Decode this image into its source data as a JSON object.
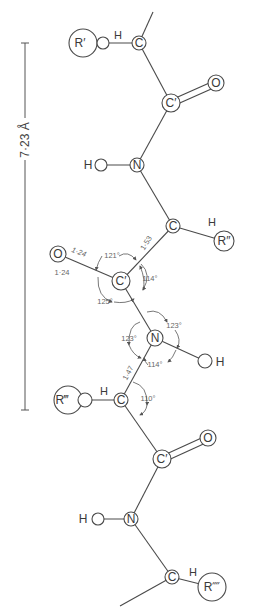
{
  "diagram": {
    "scale_bar": {
      "label": "7·23 Å"
    },
    "side_chains": [
      "R′",
      "R″",
      "R‴",
      "R⁗"
    ],
    "atoms": {
      "c_alpha": "C",
      "c_carbonyl": "C′",
      "oxygen": "O",
      "nitrogen": "N",
      "hydrogen": "H"
    },
    "bond_lengths": {
      "c_o_upper": "1·24",
      "c_o_lower": "1·24",
      "c_alpha_c": "1·53",
      "n_c_alpha": "1·47"
    },
    "angles": {
      "o_c_calpha": "121°",
      "calpha_c_n": "114°",
      "o_c_n": "125°",
      "c_n_h": "123°",
      "c_n_calpha": "123°",
      "h_n_calpha": "114°",
      "n_calpha_c": "110°"
    }
  }
}
